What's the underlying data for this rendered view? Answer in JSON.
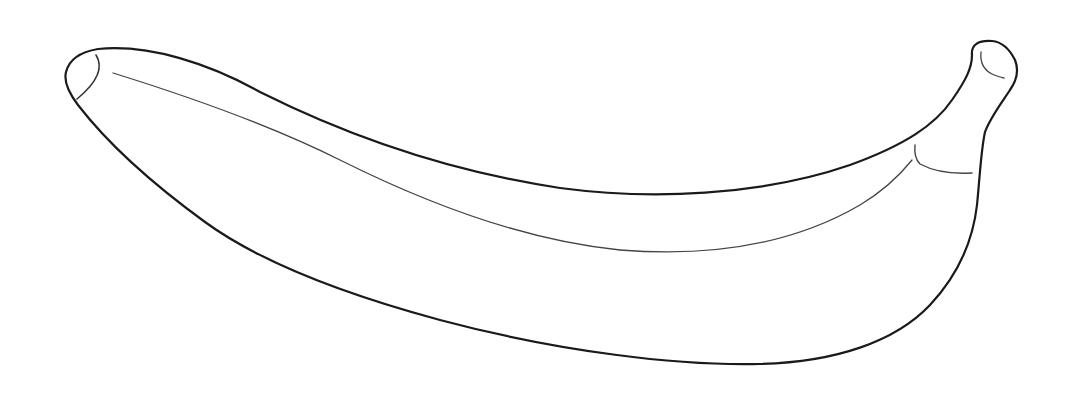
{
  "illustration": {
    "subject": "banana line drawing",
    "colors": {
      "background": "#ffffff",
      "outline": "#1a1a1a",
      "detail": "#444444"
    }
  }
}
